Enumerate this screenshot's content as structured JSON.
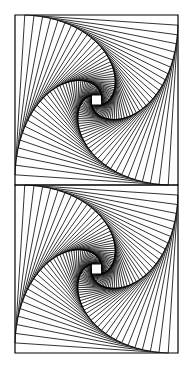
{
  "caption": "",
  "figure": {
    "type": "whirl-of-nested-squares",
    "stroke_color": "#000000",
    "background": "#ffffff",
    "panels": [
      {
        "name": "top-whirl",
        "x": 15,
        "y": 15,
        "width": 163,
        "height": 170
      },
      {
        "name": "bottom-whirl",
        "x": 15,
        "y": 185,
        "width": 163,
        "height": 168
      }
    ],
    "step_fraction": 0.06,
    "iterations": 52
  }
}
